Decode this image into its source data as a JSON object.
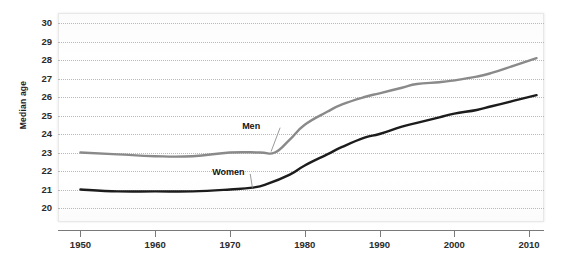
{
  "chart_data": {
    "type": "line",
    "title": "",
    "subtitle": "",
    "xlabel": "",
    "ylabel": "Median age",
    "xlim": [
      1947,
      2012
    ],
    "ylim": [
      20,
      30
    ],
    "grid": true,
    "grid_style": "dotted-horizontal",
    "legend_position": "inline-annotations",
    "y_ticks": [
      30,
      29,
      28,
      27,
      26,
      25,
      24,
      23,
      22,
      21,
      20
    ],
    "x_ticks": [
      1950,
      1960,
      1970,
      1980,
      1990,
      2000,
      2010
    ],
    "x_tick_labels": [
      "1950",
      "1960",
      "1970",
      "1980",
      "1990",
      "2000",
      "2010"
    ],
    "series": [
      {
        "name": "Men",
        "color": "#8a8a8a",
        "annotation": "Men",
        "x": [
          1950,
          1955,
          1960,
          1965,
          1970,
          1974,
          1976,
          1978,
          1980,
          1983,
          1985,
          1988,
          1990,
          1993,
          1995,
          1998,
          2000,
          2003,
          2005,
          2008,
          2011
        ],
        "values": [
          23.0,
          22.9,
          22.8,
          22.8,
          23.0,
          23.0,
          23.0,
          23.7,
          24.5,
          25.2,
          25.6,
          26.0,
          26.2,
          26.5,
          26.7,
          26.8,
          26.9,
          27.1,
          27.3,
          27.7,
          28.1
        ]
      },
      {
        "name": "Women",
        "color": "#1c1c1c",
        "annotation": "Women",
        "x": [
          1950,
          1955,
          1960,
          1965,
          1970,
          1973,
          1975,
          1978,
          1980,
          1983,
          1985,
          1988,
          1990,
          1993,
          1995,
          1998,
          2000,
          2003,
          2005,
          2008,
          2011
        ],
        "values": [
          21.0,
          20.9,
          20.9,
          20.9,
          21.0,
          21.1,
          21.3,
          21.8,
          22.3,
          22.9,
          23.3,
          23.8,
          24.0,
          24.4,
          24.6,
          24.9,
          25.1,
          25.3,
          25.5,
          25.8,
          26.1
        ]
      }
    ],
    "annotations": [
      {
        "text": "Men",
        "x": 1973.5,
        "y": 24.45,
        "leader_to_x": 1975.5,
        "leader_to_y": 23.05
      },
      {
        "text": "Women",
        "x": 1969.5,
        "y": 21.95,
        "leader_to_x": 1973.0,
        "leader_to_y": 21.1
      }
    ]
  },
  "axes": {
    "y_title": "Median age"
  }
}
